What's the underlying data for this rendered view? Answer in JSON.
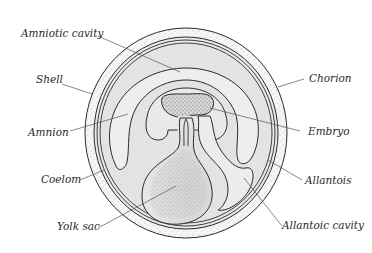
{
  "diagram": {
    "colors": {
      "background": "#ffffff",
      "outline": "#2b2b2b",
      "shell_fill": "#f4f4f4",
      "interior_fill": "#e6e6e6",
      "light_fill": "#eeeeee",
      "leader_line": "#555555",
      "label_text": "#2a2a2a"
    },
    "labels": {
      "amniotic_cavity": "Amniotic cavity",
      "shell": "Shell",
      "amnion": "Amnion",
      "coelom": "Coelom",
      "yolk_sac": "Yolk sac",
      "chorion": "Chorion",
      "embryo": "Embryo",
      "allantois": "Allantois",
      "allantoic_cavity": "Allantoic cavity"
    }
  }
}
